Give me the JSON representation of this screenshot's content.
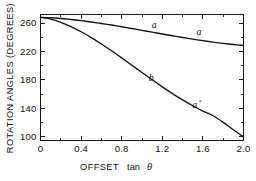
{
  "chart_data": {
    "type": "line",
    "title": "",
    "xlabel": "OFFSET tan θ",
    "xlabel_main": "OFFSET",
    "xlabel_var": "tan",
    "xlabel_theta": "θ",
    "ylabel": "ROTATION ANGLES (DEGREES)",
    "xlim": [
      0,
      2.0
    ],
    "ylim": [
      95,
      272
    ],
    "grid": false,
    "legend": "inline-curve-labels",
    "xticks": [
      0,
      0.4,
      0.8,
      1.2,
      1.6,
      2.0
    ],
    "xticklabels": [
      "0",
      "0.4",
      "0.8",
      "1.2",
      "1.6",
      "2.0"
    ],
    "xminorticks": [
      0.2,
      0.6,
      1.0,
      1.4,
      1.8
    ],
    "yticks": [
      100,
      140,
      180,
      220,
      260
    ],
    "yticklabels": [
      "100",
      "140",
      "180",
      "220",
      "260"
    ],
    "series": [
      {
        "name": "a",
        "label": "a",
        "x": [
          0.0,
          0.1,
          0.2,
          0.3,
          0.4,
          0.5,
          0.6,
          0.7,
          0.8,
          0.9,
          1.0,
          1.1,
          1.2,
          1.3,
          1.4,
          1.5,
          1.6,
          1.7,
          1.8,
          1.9,
          2.0
        ],
        "values": [
          268.0,
          267.4,
          266.4,
          265.0,
          263.4,
          261.5,
          259.4,
          257.2,
          254.8,
          252.3,
          249.8,
          247.2,
          244.6,
          242.1,
          239.7,
          237.4,
          235.2,
          233.2,
          231.4,
          229.8,
          228.4
        ]
      },
      {
        "name": "b",
        "label": "b",
        "x": [
          0.0,
          0.1,
          0.2,
          0.3,
          0.4,
          0.5,
          0.6,
          0.7,
          0.8,
          0.9,
          1.0,
          1.1,
          1.2,
          1.3,
          1.4,
          1.5,
          1.6,
          1.7,
          1.8,
          1.9,
          2.0
        ],
        "values": [
          268.0,
          265.5,
          261.0,
          255.0,
          247.8,
          239.6,
          230.6,
          221.0,
          211.0,
          200.8,
          190.5,
          180.3,
          170.4,
          160.9,
          152.0,
          143.8,
          136.4,
          129.8,
          120.5,
          110.0,
          100.0
        ]
      }
    ],
    "annotations": [
      {
        "id": "label-a-1",
        "text": "a",
        "sup": "",
        "x": 1.12,
        "y": 253.0
      },
      {
        "id": "label-a-2",
        "text": "a",
        "sup": "",
        "x": 1.56,
        "y": 243.5
      },
      {
        "id": "label-b",
        "text": "b",
        "sup": "",
        "x": 1.09,
        "y": 178.0
      },
      {
        "id": "label-a-star",
        "text": "a",
        "sup": "*",
        "x": 1.52,
        "y": 140.0
      }
    ],
    "colors": {
      "curve": "#141414",
      "axis": "#1a1a1a",
      "text": "#111111",
      "background": "#ffffff"
    }
  }
}
